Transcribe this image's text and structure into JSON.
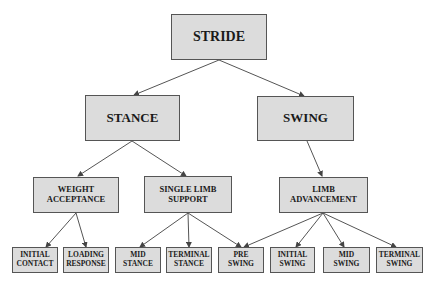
{
  "diagram": {
    "root": {
      "label": "STRIDE"
    },
    "phases": [
      {
        "label": "STANCE"
      },
      {
        "label": "SWING"
      }
    ],
    "tasks": [
      {
        "label": "WEIGHT\nACCEPTANCE"
      },
      {
        "label": "SINGLE LIMB\nSUPPORT"
      },
      {
        "label": "LIMB\nADVANCEMENT"
      }
    ],
    "subphases": [
      {
        "label": "INITIAL\nCONTACT"
      },
      {
        "label": "LOADING\nRESPONSE"
      },
      {
        "label": "MID\nSTANCE"
      },
      {
        "label": "TERMINAL\nSTANCE"
      },
      {
        "label": "PRE\nSWING"
      },
      {
        "label": "INITIAL\nSWING"
      },
      {
        "label": "MID\nSWING"
      },
      {
        "label": "TERMINAL\nSWING"
      }
    ],
    "colors": {
      "box_fill": "#dcdcdc",
      "box_border": "#555555",
      "arrow": "#444444"
    }
  }
}
